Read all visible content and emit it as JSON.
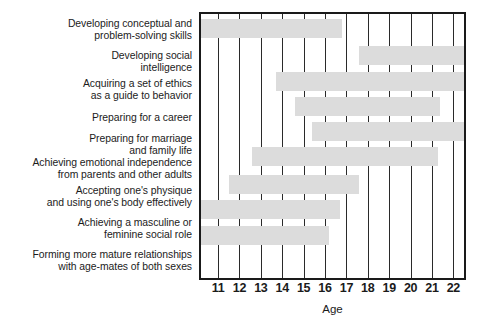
{
  "chart_data": {
    "type": "bar",
    "orientation": "horizontal",
    "subtype": "gantt-range",
    "title": "",
    "xlabel": "Age",
    "ylabel": "",
    "xlim": [
      10.2,
      22.5
    ],
    "grid": true,
    "legend": false,
    "bar_color": "#dcdcdc",
    "axis_color": "#1a1a1a",
    "xticks": [
      11,
      12,
      13,
      14,
      15,
      16,
      17,
      18,
      19,
      20,
      21,
      22
    ],
    "xticklabels": [
      "11",
      "12",
      "13",
      "14",
      "15",
      "16",
      "17",
      "18",
      "19",
      "20",
      "21",
      "22"
    ],
    "categories": [
      "Developing conceptual and\nproblem-solving skills",
      "Developing social\nintelligence",
      "Acquiring a set of ethics\nas a guide to behavior",
      "Preparing for a career",
      "Preparing for marriage\nand family life",
      "Achieving emotional independence\nfrom parents and other adults",
      "Accepting one's physique\nand using one's body effectively",
      "Achieving a masculine or\nfeminine social role",
      "Forming more mature relationships\nwith age-mates of both sexes"
    ],
    "bars": [
      {
        "label": "Developing conceptual and problem-solving skills",
        "start": 10.2,
        "end": 16.8,
        "clipped_left": true,
        "clipped_right": false
      },
      {
        "label": "Developing social intelligence",
        "start": 17.6,
        "end": 22.5,
        "clipped_left": false,
        "clipped_right": true
      },
      {
        "label": "Acquiring a set of ethics as a guide to behavior",
        "start": 13.7,
        "end": 22.5,
        "clipped_left": false,
        "clipped_right": true
      },
      {
        "label": "Preparing for a career",
        "start": 14.6,
        "end": 21.4,
        "clipped_left": false,
        "clipped_right": false
      },
      {
        "label": "Preparing for marriage and family life",
        "start": 15.4,
        "end": 22.5,
        "clipped_left": false,
        "clipped_right": true
      },
      {
        "label": "Achieving emotional independence from parents and other adults",
        "start": 12.6,
        "end": 21.3,
        "clipped_left": false,
        "clipped_right": false
      },
      {
        "label": "Accepting one's physique and using one's body effectively",
        "start": 11.5,
        "end": 17.6,
        "clipped_left": false,
        "clipped_right": false
      },
      {
        "label": "Achieving a masculine or feminine social role",
        "start": 10.2,
        "end": 16.7,
        "clipped_left": true,
        "clipped_right": false
      },
      {
        "label": "Forming more mature relationships with age-mates of both sexes",
        "start": 10.2,
        "end": 16.2,
        "clipped_left": true,
        "clipped_right": false
      }
    ]
  },
  "layout": {
    "label_tops": [
      18,
      50,
      78,
      112,
      133,
      157,
      185,
      217,
      249
    ],
    "bar_tops": [
      5,
      32,
      58,
      83,
      108,
      133,
      161,
      186,
      212
    ]
  }
}
